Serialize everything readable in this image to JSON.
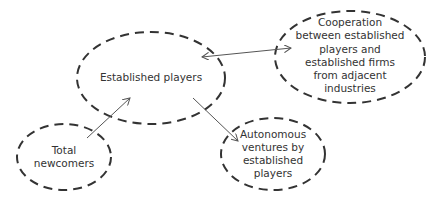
{
  "diagram": {
    "nodes": [
      {
        "id": "established",
        "lines": [
          "Established players"
        ]
      },
      {
        "id": "cooperation",
        "lines": [
          "Cooperation",
          "between established",
          "players and",
          "established firms",
          "from adjacent",
          "industries"
        ]
      },
      {
        "id": "newcomers",
        "lines": [
          "Total",
          "newcomers"
        ]
      },
      {
        "id": "autonomous",
        "lines": [
          "Autonomous",
          "ventures by",
          "established",
          "players"
        ]
      }
    ],
    "edges": [
      {
        "from": "newcomers",
        "to": "established",
        "type": "arrow"
      },
      {
        "from": "established",
        "to": "autonomous",
        "type": "arrow"
      },
      {
        "from": "established",
        "to": "cooperation",
        "type": "double-arrow"
      }
    ],
    "colors": {
      "stroke": "#333333",
      "arrow": "#555555",
      "text": "#333333"
    }
  }
}
